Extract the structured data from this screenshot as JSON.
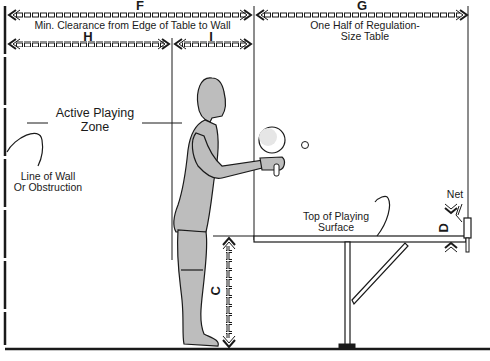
{
  "diagram": {
    "title": "",
    "dimensions": {
      "F": {
        "letter": "F",
        "caption": "Min. Clearance from Edge of Table to Wall"
      },
      "G": {
        "letter": "G",
        "caption_line1": "One Half of Regulation-",
        "caption_line2": "Size Table"
      },
      "H": {
        "letter": "H"
      },
      "I": {
        "letter": "I"
      },
      "C": {
        "letter": "C"
      },
      "D": {
        "letter": "D"
      }
    },
    "labels": {
      "active_zone_line1": "Active Playing",
      "active_zone_line2": "Zone",
      "wall_line1": "Line of Wall",
      "wall_line2": "Or Obstruction",
      "surface_line1": "Top of Playing",
      "surface_line2": "Surface",
      "net": "Net"
    },
    "colors": {
      "ink": "#1a1a1a",
      "figure_fill": "#bdbdbd",
      "background": "#ffffff"
    }
  }
}
